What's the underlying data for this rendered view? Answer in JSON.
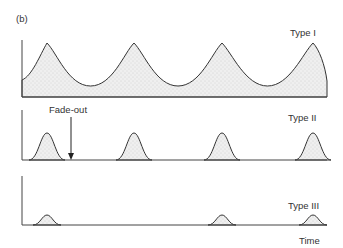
{
  "figure": {
    "panel_label": "(b)",
    "x_axis_label": "Time",
    "annotation": {
      "label": "Fade-out",
      "arrow": "down-arrow"
    },
    "colors": {
      "line": "#333333",
      "fill": "#e6e6e6"
    },
    "panels": [
      {
        "id": "type-1",
        "label": "Type I",
        "description": "Continuous oscillation, never reaches zero",
        "peaks": 4,
        "relative_amplitude": 1.0,
        "fades_out": false
      },
      {
        "id": "type-2",
        "label": "Type II",
        "description": "Epidemic peaks separated by fade-out periods",
        "peaks": 4,
        "relative_amplitude": 0.5,
        "fades_out": true
      },
      {
        "id": "type-3",
        "label": "Type III",
        "description": "Small irregular sporadic outbreaks",
        "peaks": 3,
        "relative_amplitude": 0.2,
        "fades_out": true
      }
    ]
  }
}
